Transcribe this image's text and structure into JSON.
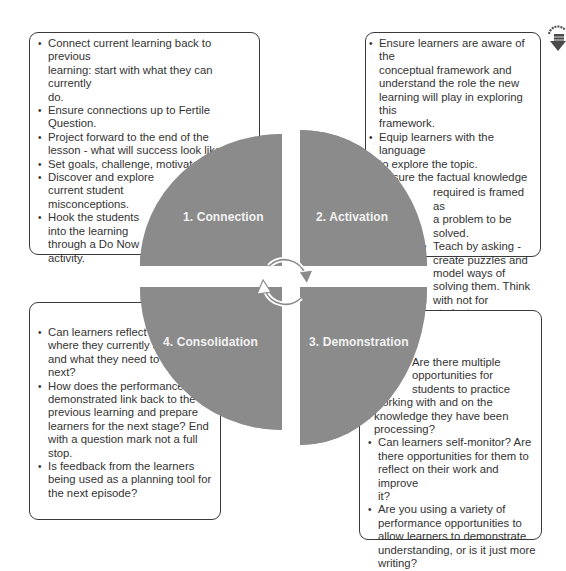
{
  "diagram": {
    "fill_color": "#8b8b8b",
    "label_color": "#f2f2f2",
    "center_icon": "cycle-arrows-icon",
    "corner_icon": "research-arrow-badge-icon",
    "corner_icon_text": "RESC"
  },
  "quadrants": [
    {
      "label": "1. Connection"
    },
    {
      "label": "2. Activation"
    },
    {
      "label": "3. Demonstration"
    },
    {
      "label": "4. Consolidation"
    }
  ],
  "connection_box": {
    "bullets": [
      "Connect current learning back to previous learning: start with what they can currently do.",
      "Ensure connections up to Fertile Question.",
      "Project forward to the end of the lesson - what will success look like.",
      "Set goals, challenge, motivate.",
      "Discover and explore current student misconceptions.",
      "Hook the students into the learning through a Do Now activity."
    ],
    "lines": [
      [
        "Connect current learning back to previous",
        "learning: start with what they can currently",
        "do."
      ],
      [
        "Ensure connections up to Fertile Question."
      ],
      [
        "Project forward to the end of the",
        "lesson - what will success look like."
      ],
      [
        "Set goals, challenge, motivate."
      ],
      [
        "Discover and explore",
        "current student",
        "misconceptions."
      ],
      [
        "Hook the students",
        "into the learning",
        "through a Do Now",
        "activity."
      ]
    ]
  },
  "activation_box": {
    "lines": [
      [
        "Ensure learners are aware of the",
        "conceptual framework and",
        "understand the role the new",
        "learning will play in exploring this",
        "framework."
      ],
      [
        "Equip learners with the language",
        "to explore the topic."
      ],
      [
        "Ensure the factual knowledge",
        "required is framed as",
        "a problem to be",
        "solved."
      ],
      [
        "Teach by asking -",
        "create puzzles and",
        "model ways of",
        "solving them. Think",
        "with not for students."
      ]
    ]
  },
  "consolidation_box": {
    "lines": [
      [
        "Can learners reflect on",
        "where they currently are",
        "and what they need to do",
        "next?"
      ],
      [
        "How does the performance",
        "demonstrated link back to the",
        "previous learning and prepare",
        "learners for the next stage? End",
        "with a question mark not a full",
        "stop."
      ],
      [
        "Is feedback from the learners",
        "being used as a planning tool for",
        "the next episode?"
      ]
    ]
  },
  "demonstration_box": {
    "lines": [
      [
        "Are there multiple",
        "opportunities for",
        "students to practice",
        "working with and on the",
        "knowledge they have been",
        "processing?"
      ],
      [
        "Can learners self-monitor? Are",
        "there opportunities for them to",
        "reflect on their work and improve",
        "it?"
      ],
      [
        "Are you using a variety of",
        "performance opportunities to",
        "allow learners to demonstrate",
        "understanding, or is it just more",
        "writing?"
      ]
    ]
  }
}
